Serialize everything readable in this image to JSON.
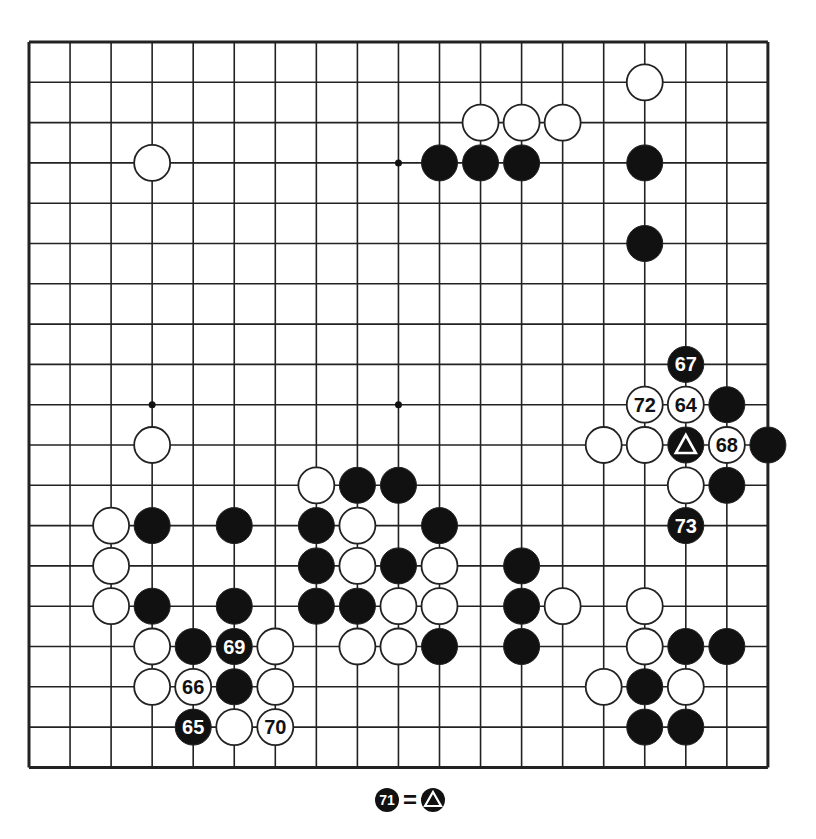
{
  "board": {
    "size": 19,
    "origin_x": 29,
    "origin_y": 42,
    "spacing_x": 41.05,
    "spacing_y": 40.3,
    "stone_radius": 18,
    "line_color": "#222222",
    "star_points": [
      [
        9,
        3
      ],
      [
        3,
        9
      ],
      [
        9,
        9
      ]
    ],
    "black_stones": [
      [
        10,
        3
      ],
      [
        11,
        3
      ],
      [
        12,
        3
      ],
      [
        15,
        3
      ],
      [
        15,
        5
      ],
      [
        17,
        9
      ],
      [
        18,
        10
      ],
      [
        17,
        11
      ],
      [
        3,
        12
      ],
      [
        5,
        12
      ],
      [
        3,
        14
      ],
      [
        5,
        14
      ],
      [
        8,
        11
      ],
      [
        9,
        11
      ],
      [
        7,
        12
      ],
      [
        10,
        12
      ],
      [
        7,
        13
      ],
      [
        9,
        13
      ],
      [
        7,
        14
      ],
      [
        8,
        14
      ],
      [
        10,
        15
      ],
      [
        12,
        13
      ],
      [
        12,
        14
      ],
      [
        12,
        15
      ],
      [
        16,
        15
      ],
      [
        17,
        15
      ],
      [
        15,
        16
      ],
      [
        15,
        17
      ],
      [
        16,
        17
      ],
      [
        4,
        15
      ],
      [
        5,
        16
      ]
    ],
    "white_stones": [
      [
        15,
        1
      ],
      [
        11,
        2
      ],
      [
        12,
        2
      ],
      [
        13,
        2
      ],
      [
        3,
        3
      ],
      [
        3,
        10
      ],
      [
        14,
        10
      ],
      [
        15,
        10
      ],
      [
        16,
        11
      ],
      [
        2,
        12
      ],
      [
        2,
        13
      ],
      [
        2,
        14
      ],
      [
        7,
        11
      ],
      [
        8,
        12
      ],
      [
        8,
        13
      ],
      [
        10,
        13
      ],
      [
        9,
        14
      ],
      [
        10,
        14
      ],
      [
        8,
        15
      ],
      [
        9,
        15
      ],
      [
        13,
        14
      ],
      [
        15,
        14
      ],
      [
        15,
        15
      ],
      [
        14,
        16
      ],
      [
        16,
        16
      ],
      [
        3,
        15
      ],
      [
        6,
        15
      ],
      [
        3,
        16
      ],
      [
        6,
        16
      ],
      [
        5,
        17
      ]
    ],
    "numbered_stones": [
      {
        "col": 16,
        "row": 9,
        "color": "white",
        "label": "64"
      },
      {
        "col": 4,
        "row": 17,
        "color": "black",
        "label": "65"
      },
      {
        "col": 4,
        "row": 16,
        "color": "white",
        "label": "66"
      },
      {
        "col": 16,
        "row": 8,
        "color": "black",
        "label": "67"
      },
      {
        "col": 17,
        "row": 10,
        "color": "white",
        "label": "68"
      },
      {
        "col": 5,
        "row": 15,
        "color": "black",
        "label": "69"
      },
      {
        "col": 6,
        "row": 17,
        "color": "white",
        "label": "70"
      },
      {
        "col": 15,
        "row": 9,
        "color": "white",
        "label": "72"
      },
      {
        "col": 16,
        "row": 12,
        "color": "black",
        "label": "73"
      }
    ],
    "marked_stones": [
      {
        "col": 16,
        "row": 10,
        "color": "black",
        "mark": "triangle"
      }
    ]
  },
  "caption": {
    "move_label": "71",
    "equals": "=",
    "refers_to": "triangle-marked stone"
  }
}
